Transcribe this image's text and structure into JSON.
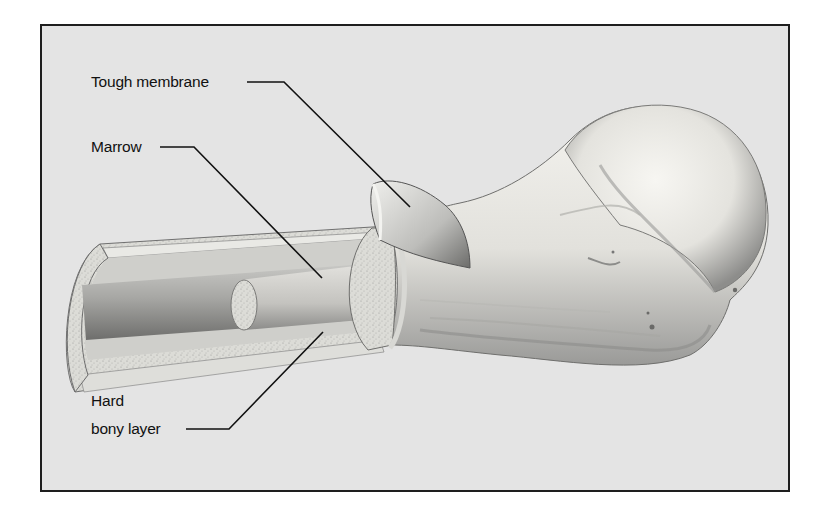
{
  "figure": {
    "labels": [
      {
        "id": "tough-membrane",
        "text": "Tough membrane"
      },
      {
        "id": "marrow",
        "text": "Marrow"
      },
      {
        "id": "hard-bony-layer",
        "lines": [
          "Hard",
          "bony layer"
        ]
      }
    ]
  },
  "colors": {
    "frame_border": "#1e1e1e",
    "frame_background": "#e4e4e4",
    "leader_line": "#111111",
    "bone_light": "#f1f0ec",
    "bone_shadow": "#8a8a8a"
  }
}
